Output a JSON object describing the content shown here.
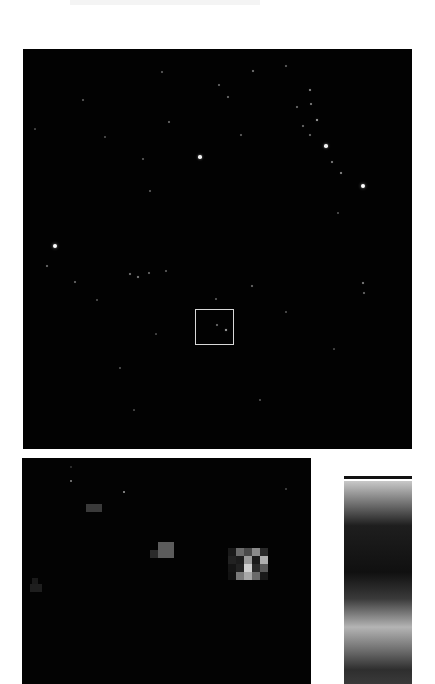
{
  "header": {
    "title": ""
  },
  "main_image": {
    "background": "#020202",
    "selection_box": {
      "x": 172,
      "y": 260,
      "width": 39,
      "height": 36,
      "color": "#d8d8d8"
    },
    "stars": [
      {
        "x": 32,
        "y": 197,
        "r": 2.2,
        "b": 1.0
      },
      {
        "x": 177,
        "y": 108,
        "r": 1.8,
        "b": 0.95
      },
      {
        "x": 340,
        "y": 137,
        "r": 2.2,
        "b": 1.0
      },
      {
        "x": 303,
        "y": 97,
        "r": 1.8,
        "b": 0.95
      },
      {
        "x": 294,
        "y": 71,
        "r": 1.2,
        "b": 0.7
      },
      {
        "x": 287,
        "y": 41,
        "r": 1.1,
        "b": 0.6
      },
      {
        "x": 288,
        "y": 55,
        "r": 1.0,
        "b": 0.55
      },
      {
        "x": 309,
        "y": 113,
        "r": 1.0,
        "b": 0.55
      },
      {
        "x": 318,
        "y": 124,
        "r": 1.1,
        "b": 0.6
      },
      {
        "x": 287,
        "y": 86,
        "r": 0.9,
        "b": 0.45
      },
      {
        "x": 280,
        "y": 77,
        "r": 0.9,
        "b": 0.45
      },
      {
        "x": 274,
        "y": 58,
        "r": 0.9,
        "b": 0.45
      },
      {
        "x": 230,
        "y": 22,
        "r": 1.0,
        "b": 0.5
      },
      {
        "x": 205,
        "y": 48,
        "r": 0.9,
        "b": 0.45
      },
      {
        "x": 196,
        "y": 36,
        "r": 0.8,
        "b": 0.4
      },
      {
        "x": 218,
        "y": 86,
        "r": 0.9,
        "b": 0.4
      },
      {
        "x": 146,
        "y": 73,
        "r": 0.8,
        "b": 0.4
      },
      {
        "x": 139,
        "y": 23,
        "r": 0.7,
        "b": 0.35
      },
      {
        "x": 120,
        "y": 110,
        "r": 0.8,
        "b": 0.35
      },
      {
        "x": 127,
        "y": 142,
        "r": 0.8,
        "b": 0.35
      },
      {
        "x": 60,
        "y": 51,
        "r": 0.8,
        "b": 0.35
      },
      {
        "x": 82,
        "y": 88,
        "r": 0.7,
        "b": 0.3
      },
      {
        "x": 24,
        "y": 217,
        "r": 0.9,
        "b": 0.45
      },
      {
        "x": 52,
        "y": 233,
        "r": 0.8,
        "b": 0.4
      },
      {
        "x": 107,
        "y": 225,
        "r": 1.0,
        "b": 0.5
      },
      {
        "x": 115,
        "y": 228,
        "r": 1.2,
        "b": 0.55
      },
      {
        "x": 126,
        "y": 224,
        "r": 0.8,
        "b": 0.4
      },
      {
        "x": 143,
        "y": 222,
        "r": 0.7,
        "b": 0.35
      },
      {
        "x": 74,
        "y": 251,
        "r": 0.7,
        "b": 0.3
      },
      {
        "x": 194,
        "y": 276,
        "r": 0.9,
        "b": 0.45
      },
      {
        "x": 203,
        "y": 281,
        "r": 1.2,
        "b": 0.7
      },
      {
        "x": 263,
        "y": 17,
        "r": 0.9,
        "b": 0.4
      },
      {
        "x": 229,
        "y": 237,
        "r": 1.0,
        "b": 0.45
      },
      {
        "x": 340,
        "y": 234,
        "r": 1.1,
        "b": 0.55
      },
      {
        "x": 341,
        "y": 244,
        "r": 0.8,
        "b": 0.4
      },
      {
        "x": 263,
        "y": 263,
        "r": 0.7,
        "b": 0.3
      },
      {
        "x": 237,
        "y": 351,
        "r": 0.7,
        "b": 0.3
      },
      {
        "x": 97,
        "y": 319,
        "r": 0.7,
        "b": 0.3
      },
      {
        "x": 111,
        "y": 361,
        "r": 0.6,
        "b": 0.25
      },
      {
        "x": 311,
        "y": 300,
        "r": 0.6,
        "b": 0.25
      },
      {
        "x": 193,
        "y": 250,
        "r": 0.8,
        "b": 0.35
      },
      {
        "x": 133,
        "y": 285,
        "r": 0.6,
        "b": 0.25
      },
      {
        "x": 315,
        "y": 164,
        "r": 0.7,
        "b": 0.3
      },
      {
        "x": 12,
        "y": 80,
        "r": 0.6,
        "b": 0.25
      }
    ]
  },
  "zoom_inset": {
    "background": "#030303",
    "pixel_size": 8,
    "features": [
      {
        "x": 136,
        "y": 84,
        "w": 16,
        "h": 16,
        "gray": "#5c5c5c"
      },
      {
        "x": 128,
        "y": 92,
        "w": 8,
        "h": 8,
        "gray": "#2a2a2a"
      },
      {
        "x": 64,
        "y": 46,
        "w": 16,
        "h": 8,
        "gray": "#3a3a3a"
      },
      {
        "x": 10,
        "y": 120,
        "w": 6,
        "h": 6,
        "gray": "#1a1a1a"
      },
      {
        "x": 8,
        "y": 126,
        "w": 12,
        "h": 8,
        "gray": "#1e1e1e"
      }
    ],
    "bright_star_grid": {
      "x": 206,
      "y": 90,
      "cell": 8,
      "rows": [
        [
          "#1a1a1a",
          "#6b6b6b",
          "#4a4a4a",
          "#8a8a8a",
          "#2a2a2a"
        ],
        [
          "#222222",
          "#1c1c1c",
          "#9a9a9a",
          "#1a1a1a",
          "#b0b0b0"
        ],
        [
          "#151515",
          "#222222",
          "#d0d0d0",
          "#2a2a2a",
          "#5a5a5a"
        ],
        [
          "#121212",
          "#7a7a7a",
          "#a8a8a8",
          "#6a6a6a",
          "#1a1a1a"
        ]
      ]
    },
    "tiny_points": [
      {
        "x": 48,
        "y": 22,
        "gray": "#6a6a6a"
      },
      {
        "x": 101,
        "y": 33,
        "gray": "#7a7a7a"
      },
      {
        "x": 263,
        "y": 30,
        "gray": "#3a3a3a"
      },
      {
        "x": 48,
        "y": 8,
        "gray": "#2a2a2a"
      }
    ]
  },
  "colorbar": {
    "cap_color": "#111111",
    "stops": [
      {
        "pos": 0,
        "color": "#c8c8c8"
      },
      {
        "pos": 10,
        "color": "#7a7a7a"
      },
      {
        "pos": 22,
        "color": "#1e1e1e"
      },
      {
        "pos": 45,
        "color": "#101010"
      },
      {
        "pos": 58,
        "color": "#3a3a3a"
      },
      {
        "pos": 72,
        "color": "#b4b4b4"
      },
      {
        "pos": 84,
        "color": "#6a6a6a"
      },
      {
        "pos": 93,
        "color": "#2e2e2e"
      },
      {
        "pos": 100,
        "color": "#3a3a3a"
      }
    ]
  }
}
